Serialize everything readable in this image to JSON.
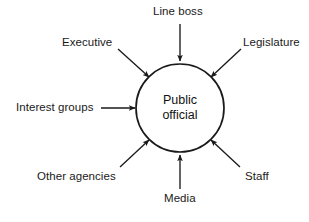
{
  "diagram": {
    "type": "hub-and-spoke influence diagram",
    "background_color": "#ffffff",
    "stroke_color": "#1a1a1a",
    "center": {
      "name": "public-official",
      "line1": "Public",
      "line2": "official",
      "shape": "circle",
      "cx": 180,
      "cy": 108,
      "r": 44
    },
    "nodes": [
      {
        "id": "line-boss",
        "label": "Line boss",
        "position": "top",
        "label_x": 153,
        "label_y": 5,
        "arrow": {
          "x1": 180,
          "y1": 24,
          "x2": 180,
          "y2": 61,
          "direction": "down"
        }
      },
      {
        "id": "executive",
        "label": "Executive",
        "position": "top-left",
        "label_x": 62,
        "label_y": 36,
        "arrow": {
          "x1": 118,
          "y1": 49,
          "x2": 149,
          "y2": 77,
          "direction": "down-right"
        }
      },
      {
        "id": "legislature",
        "label": "Legislature",
        "position": "top-right",
        "label_x": 243,
        "label_y": 36,
        "arrow": {
          "x1": 241,
          "y1": 49,
          "x2": 211,
          "y2": 77,
          "direction": "down-left"
        }
      },
      {
        "id": "interest-groups",
        "label": "Interest groups",
        "position": "left",
        "label_x": 16,
        "label_y": 101,
        "arrow": {
          "x1": 101,
          "y1": 108,
          "x2": 135,
          "y2": 108,
          "direction": "right"
        }
      },
      {
        "id": "staff",
        "label": "Staff",
        "position": "bottom-right",
        "label_x": 245,
        "label_y": 170,
        "arrow": {
          "x1": 240,
          "y1": 167,
          "x2": 211,
          "y2": 140,
          "direction": "up-left"
        }
      },
      {
        "id": "media",
        "label": "Media",
        "position": "bottom",
        "label_x": 164,
        "label_y": 192,
        "arrow": {
          "x1": 180,
          "y1": 189,
          "x2": 180,
          "y2": 155,
          "direction": "up"
        }
      },
      {
        "id": "other-agencies",
        "label": "Other agencies",
        "position": "bottom-left",
        "label_x": 37,
        "label_y": 170,
        "arrow": {
          "x1": 120,
          "y1": 167,
          "x2": 149,
          "y2": 140,
          "direction": "up-right"
        }
      }
    ]
  }
}
